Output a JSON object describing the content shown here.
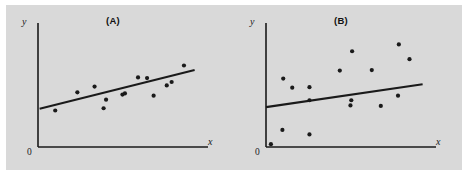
{
  "figure": {
    "background_color": "#d9d9d9",
    "ink_color": "#1a1a1a",
    "page_background": "#ffffff"
  },
  "chart_data": [
    {
      "type": "scatter",
      "title": "(A)",
      "xlabel": "x",
      "ylabel": "y",
      "origin_label": "0",
      "grid": false,
      "legend": null,
      "axis_ticks": [],
      "xlim": [
        0,
        100
      ],
      "ylim": [
        0,
        100
      ],
      "description": "Scatter of points with a fitted straight regression line; points cluster tightly about the line (strong positive linear relationship).",
      "points": [
        {
          "x": 10.5,
          "y": 32.0
        },
        {
          "x": 24.0,
          "y": 48.0
        },
        {
          "x": 34.5,
          "y": 53.0
        },
        {
          "x": 41.5,
          "y": 41.5
        },
        {
          "x": 40.0,
          "y": 34.0
        },
        {
          "x": 53.0,
          "y": 47.0
        },
        {
          "x": 51.5,
          "y": 46.0
        },
        {
          "x": 61.0,
          "y": 61.0
        },
        {
          "x": 66.5,
          "y": 60.5
        },
        {
          "x": 70.5,
          "y": 45.0
        },
        {
          "x": 78.5,
          "y": 54.0
        },
        {
          "x": 81.5,
          "y": 57.0
        },
        {
          "x": 89.0,
          "y": 71.5
        }
      ],
      "fit_line": {
        "x0": 1.0,
        "y0": 33.5,
        "x1": 95.5,
        "y1": 67.5
      }
    },
    {
      "type": "scatter",
      "title": "(B)",
      "xlabel": "x",
      "ylabel": "y",
      "origin_label": "0",
      "grid": false,
      "legend": null,
      "axis_ticks": [],
      "xlim": [
        0,
        100
      ],
      "ylim": [
        0,
        100
      ],
      "description": "Scatter of points with a fitted straight regression line; points are widely dispersed about the line (weak positive linear relationship).",
      "points": [
        {
          "x": 3.0,
          "y": 2.5
        },
        {
          "x": 10.0,
          "y": 15.0
        },
        {
          "x": 10.5,
          "y": 60.0
        },
        {
          "x": 16.0,
          "y": 52.0
        },
        {
          "x": 26.5,
          "y": 11.0
        },
        {
          "x": 26.5,
          "y": 41.0
        },
        {
          "x": 26.5,
          "y": 52.5
        },
        {
          "x": 52.0,
          "y": 41.0
        },
        {
          "x": 51.5,
          "y": 36.5
        },
        {
          "x": 45.0,
          "y": 67.0
        },
        {
          "x": 52.5,
          "y": 84.0
        },
        {
          "x": 64.5,
          "y": 67.5
        },
        {
          "x": 81.0,
          "y": 90.0
        },
        {
          "x": 87.5,
          "y": 77.0
        },
        {
          "x": 80.5,
          "y": 45.0
        },
        {
          "x": 70.0,
          "y": 36.0
        }
      ],
      "fit_line": {
        "x0": 0.0,
        "y0": 35.0,
        "x1": 95.5,
        "y1": 55.0
      }
    }
  ]
}
